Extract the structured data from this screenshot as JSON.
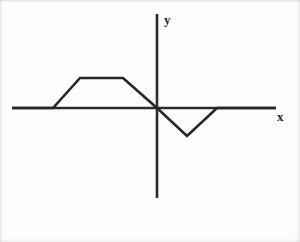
{
  "figure": {
    "axis_labels": {
      "x": "x",
      "y": "y"
    },
    "colors": {
      "curve": "#262626",
      "axis": "#2b2b2b",
      "background": "#fdfdfd"
    }
  },
  "chart_data": {
    "type": "line",
    "title": "",
    "xlabel": "x",
    "ylabel": "y",
    "grid": false,
    "legend": null,
    "axis_origin_px": [
      157,
      108
    ],
    "x_axis_extent_px": [
      12,
      276
    ],
    "y_axis_extent_px": [
      14,
      198
    ],
    "series": [
      {
        "name": "f(x)",
        "points_px": [
          [
            12,
            108
          ],
          [
            53,
            108
          ],
          [
            80,
            78
          ],
          [
            123,
            78
          ],
          [
            157,
            108
          ],
          [
            187,
            136
          ],
          [
            217,
            108
          ],
          [
            276,
            108
          ]
        ],
        "x": [
          -5.8,
          -3.6,
          -2.4,
          -0.9,
          0.0,
          1.0,
          2.0,
          4.0
        ],
        "values": [
          0.0,
          0.0,
          1.0,
          1.0,
          0.0,
          -0.93,
          0.0,
          0.0
        ]
      }
    ],
    "xlim": [
      -5.8,
      4.0
    ],
    "ylim": [
      -1.2,
      1.2
    ],
    "vertices": [
      {
        "label": "left-zero-start",
        "x": -5.8,
        "y": 0.0
      },
      {
        "label": "ramp-foot",
        "x": -3.6,
        "y": 0.0
      },
      {
        "label": "plateau-left",
        "x": -2.4,
        "y": 1.0
      },
      {
        "label": "plateau-right",
        "x": -0.9,
        "y": 1.0
      },
      {
        "label": "origin-crossing",
        "x": 0.0,
        "y": 0.0
      },
      {
        "label": "trough-bottom",
        "x": 1.0,
        "y": -0.93
      },
      {
        "label": "return-to-zero",
        "x": 2.0,
        "y": 0.0
      },
      {
        "label": "right-zero-end",
        "x": 4.0,
        "y": 0.0
      }
    ]
  }
}
